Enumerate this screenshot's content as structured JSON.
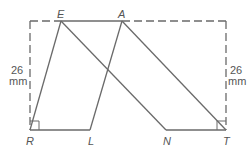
{
  "diagram": {
    "points": {
      "E": {
        "label": "E",
        "x": 61,
        "y": 21
      },
      "A": {
        "label": "A",
        "x": 122,
        "y": 21
      },
      "R": {
        "label": "R",
        "x": 30,
        "y": 130
      },
      "L": {
        "label": "L",
        "x": 90,
        "y": 130
      },
      "N": {
        "label": "N",
        "x": 166,
        "y": 130
      },
      "T": {
        "label": "T",
        "x": 226,
        "y": 130
      }
    },
    "segments": [
      [
        "E",
        "R"
      ],
      [
        "R",
        "L"
      ],
      [
        "L",
        "A"
      ],
      [
        "E",
        "N"
      ],
      [
        "N",
        "T"
      ],
      [
        "T",
        "A"
      ]
    ],
    "dashed_rectangle": {
      "x1": 30,
      "y1": 21,
      "x2": 226,
      "y2": 130
    },
    "right_angles": [
      "R",
      "T"
    ],
    "dimensions": {
      "left": {
        "value": "26",
        "unit": "mm"
      },
      "right": {
        "value": "26",
        "unit": "mm"
      }
    },
    "colors": {
      "line": "#6a6a6a",
      "text": "#555555"
    }
  }
}
